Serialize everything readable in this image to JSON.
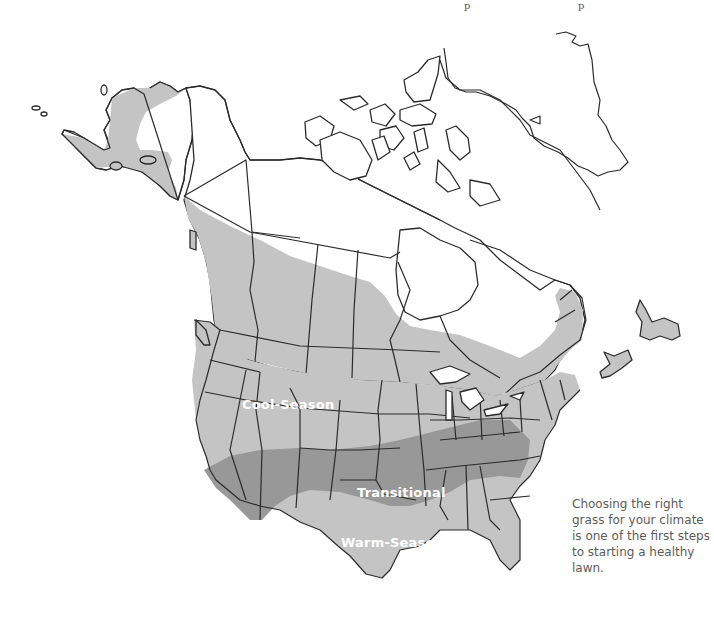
{
  "map": {
    "title_fragments": [
      "p",
      "p"
    ],
    "zones": [
      {
        "id": "cool",
        "label": "Cool-Season",
        "color": "#c4c4c4"
      },
      {
        "id": "transitional",
        "label": "Transitional",
        "color": "#989898"
      },
      {
        "id": "warm",
        "label": "Warm-Season",
        "color": "#c4c4c4"
      }
    ],
    "outline_color": "#2b2b2b",
    "background": "#ffffff"
  },
  "caption": {
    "text": "Choosing the right grass for your climate is one of the first steps to starting a healthy lawn."
  }
}
